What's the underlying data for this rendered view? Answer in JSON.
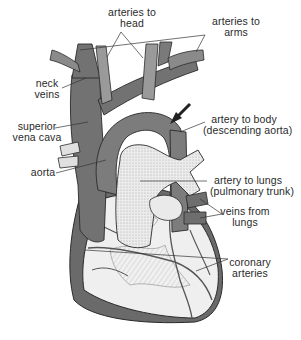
{
  "diagram": {
    "colors": {
      "background": "#ffffff",
      "veins_dark": "#6e6e6e",
      "arteries_mid": "#8c8c8c",
      "aorta": "#7a7a7a",
      "pulmonary_light": "#e6e6e6",
      "heart_surface": "#eeeeee",
      "outline": "#2a2a2a",
      "text": "#2a2a2a"
    },
    "labels": {
      "arteries_to_head": {
        "line1": "arteries to",
        "line2": "head"
      },
      "arteries_to_arms": {
        "line1": "arteries to",
        "line2": "arms"
      },
      "neck_veins": {
        "line1": "neck",
        "line2": "veins"
      },
      "superior_vena_cava": {
        "line1": "superior",
        "line2": "vena cava"
      },
      "artery_to_body": {
        "line1": "artery to body",
        "line2": "(descending aorta)"
      },
      "aorta": {
        "line1": "aorta"
      },
      "artery_to_lungs": {
        "line1": "artery to lungs",
        "line2": "(pulmonary trunk)"
      },
      "veins_from_lungs": {
        "line1": "veins from",
        "line2": "lungs"
      },
      "coronary_arteries": {
        "line1": "coronary",
        "line2": "arteries"
      }
    },
    "pointer_arrow": {
      "points_to": "artery to body (descending aorta)"
    }
  }
}
